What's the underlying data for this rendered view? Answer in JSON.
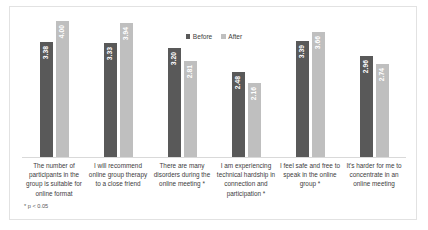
{
  "chart_data": {
    "type": "bar",
    "title": "",
    "subtitle": "",
    "xlabel": "",
    "ylabel": "",
    "ylim": [
      0,
      4.4
    ],
    "grid": false,
    "legend_position": "top-center",
    "categories": [
      "The number of participants in the group is suitable for online format",
      "I will recommend online group therapy to a close friend",
      "There are many disorders during the online meeting  *",
      "I am experiencing technical hardship in connection and participation  *",
      "I feel safe and free to speak in the online group  *",
      "It's harder for me to concentrate in an online meeting"
    ],
    "series": [
      {
        "name": "Before",
        "color": "#595959",
        "values": [
          3.38,
          3.33,
          3.2,
          2.48,
          3.39,
          2.96
        ],
        "labels": [
          "3.38",
          "3.33",
          "3.20",
          "2.48",
          "3.39",
          "2.96"
        ]
      },
      {
        "name": "After",
        "color": "#BFBFBF",
        "values": [
          4.0,
          3.94,
          2.81,
          2.16,
          3.66,
          2.74
        ],
        "labels": [
          "4.00",
          "3.94",
          "2.81",
          "2.16",
          "3.66",
          "2.74"
        ]
      }
    ],
    "annotations": [
      "* p < 0.05"
    ]
  },
  "legend": {
    "entries": [
      {
        "label": "Before",
        "color": "#595959"
      },
      {
        "label": "After",
        "color": "#BFBFBF"
      }
    ]
  },
  "footnote": {
    "text": "* p < 0.05"
  }
}
